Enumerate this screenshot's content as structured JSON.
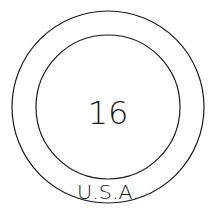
{
  "emblem": {
    "number": "16",
    "country": "U.S.A.",
    "stroke_color": "#1a1a1a",
    "background_color": "#ffffff"
  }
}
